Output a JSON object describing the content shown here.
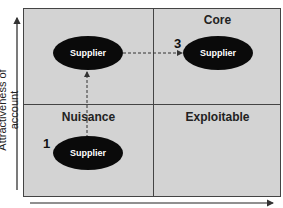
{
  "diagram": {
    "y_axis_label": "Attractiveness of account",
    "x_axis_label": "",
    "quadrants": [
      {
        "position": "top-left",
        "label": ""
      },
      {
        "position": "top-right",
        "label": "Core"
      },
      {
        "position": "bottom-left",
        "label": "Nuisance"
      },
      {
        "position": "bottom-right",
        "label": "Exploitable"
      }
    ],
    "nodes": [
      {
        "id": "n1",
        "label": "Supplier",
        "number": "1"
      },
      {
        "id": "n2",
        "label": "Supplier",
        "number": ""
      },
      {
        "id": "n3",
        "label": "Supplier",
        "number": "3"
      }
    ],
    "colors": {
      "background": "#d3d3d3",
      "node": "#0a0a0a",
      "line": "#444444"
    }
  }
}
